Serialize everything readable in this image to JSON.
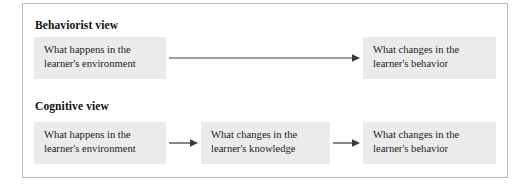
{
  "figure": {
    "border_color": "#b9b9b9",
    "background_color": "#ffffff",
    "box_fill_color": "#ebebeb",
    "arrow_color": "#3a3a3a",
    "text_color": "#1c1c1c"
  },
  "sections": [
    {
      "id": "behaviorist",
      "heading": "Behaviorist view",
      "boxes": [
        {
          "id": "behaviorist-environment",
          "line1": "What happens in the",
          "line2": "learner's environment"
        },
        {
          "id": "behaviorist-behavior",
          "line1": "What changes in the",
          "line2": "learner's behavior"
        }
      ],
      "arrows": [
        {
          "id": "behaviorist-arrow-main",
          "from": "behaviorist-environment",
          "to": "behaviorist-behavior",
          "style": "long"
        }
      ]
    },
    {
      "id": "cognitive",
      "heading": "Cognitive view",
      "boxes": [
        {
          "id": "cognitive-environment",
          "line1": "What happens in the",
          "line2": "learner's environment"
        },
        {
          "id": "cognitive-knowledge",
          "line1": "What changes in the",
          "line2": "learner's knowledge"
        },
        {
          "id": "cognitive-behavior",
          "line1": "What changes in the",
          "line2": "learner's behavior"
        }
      ],
      "arrows": [
        {
          "id": "cognitive-arrow-1",
          "from": "cognitive-environment",
          "to": "cognitive-knowledge",
          "style": "short"
        },
        {
          "id": "cognitive-arrow-2",
          "from": "cognitive-knowledge",
          "to": "cognitive-behavior",
          "style": "short"
        }
      ]
    }
  ]
}
